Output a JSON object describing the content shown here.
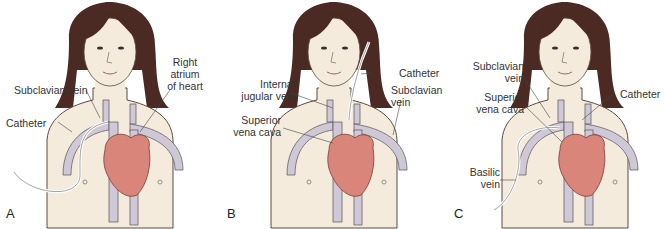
{
  "colors": {
    "skin": "#f4ebdd",
    "skin_outline": "#5a4a40",
    "hair": "#4a2a22",
    "vein": "#cfc8d6",
    "vein_outline": "#555055",
    "heart": "#d9857a",
    "heart_outline": "#7a3b35",
    "catheter": "#e8e4e8",
    "label_text": "#333333"
  },
  "panels": [
    {
      "letter": "A",
      "labels": {
        "subclavian_vein": "Subclavian vein",
        "catheter": "Catheter",
        "right_atrium_1": "Right",
        "right_atrium_2": "atrium",
        "right_atrium_3": "of heart"
      }
    },
    {
      "letter": "B",
      "labels": {
        "internal_jugular_1": "Internal",
        "internal_jugular_2": "jugular vein",
        "catheter": "Catheter",
        "subclavian_1": "Subclavian",
        "subclavian_2": "vein",
        "svc_1": "Superior",
        "svc_2": "vena cava"
      }
    },
    {
      "letter": "C",
      "labels": {
        "subclavian_1": "Subclavian",
        "subclavian_2": "vein",
        "svc_1": "Superior",
        "svc_2": "vena cava",
        "catheter": "Catheter",
        "basilic_1": "Basilic",
        "basilic_2": "vein"
      }
    }
  ]
}
